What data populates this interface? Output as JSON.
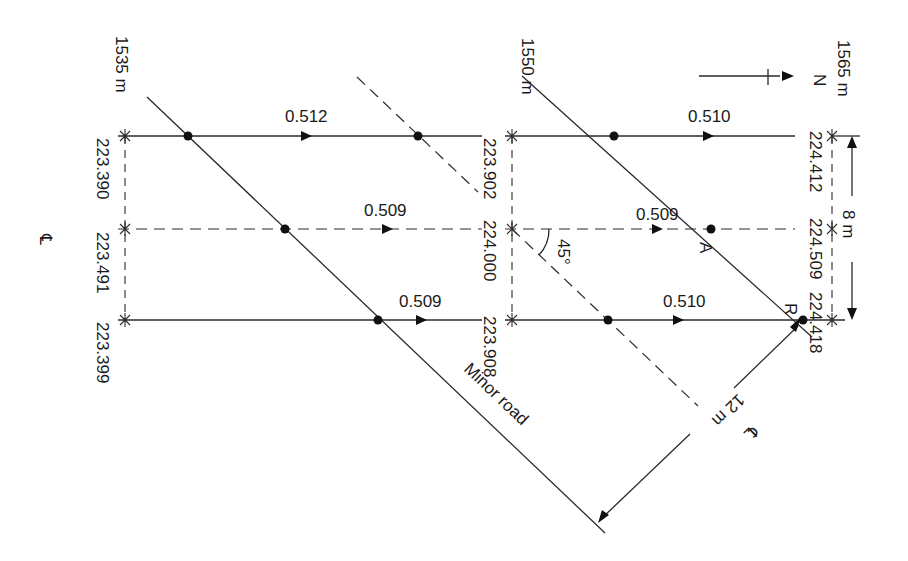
{
  "diagram": {
    "type": "road-junction-levelling-plan",
    "north_label": "N",
    "centerline_symbol": "℄",
    "chainages": [
      "1535 m",
      "1550 m",
      "1565 m"
    ],
    "levels": {
      "c1535": [
        "223.390",
        "223.491",
        "223.399"
      ],
      "c1550": [
        "223.902",
        "224.000",
        "223.908"
      ],
      "c1565": [
        "224.412",
        "224.509",
        "224.418"
      ]
    },
    "gradients": {
      "left": [
        "0.512",
        "0.509",
        "0.509"
      ],
      "right": [
        "0.510",
        "0.509",
        "0.510"
      ]
    },
    "angle_label": "45°",
    "point_labels": {
      "a": "A",
      "r": "R"
    },
    "width_dimension": "8 m",
    "radius_dimension": "12 m",
    "road_label": "Minor road"
  }
}
